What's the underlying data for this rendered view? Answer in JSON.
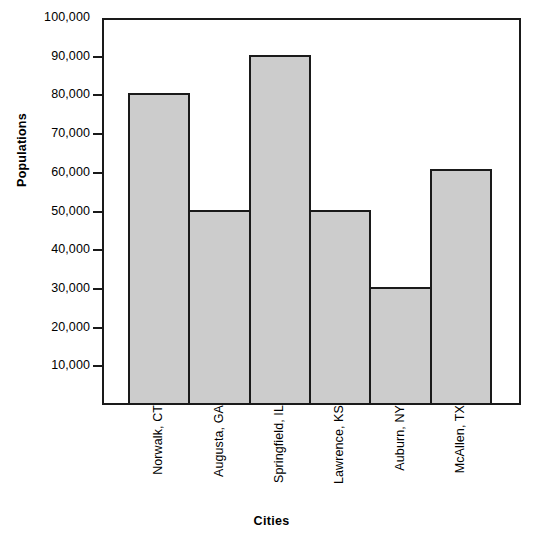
{
  "chart_data": {
    "type": "bar",
    "title": "",
    "xlabel": "Cities",
    "ylabel": "Populations",
    "categories": [
      "Norwalk, CT",
      "Augusta, GA",
      "Springfield, IL",
      "Lawrence, KS",
      "Auburn, NY",
      "McAllen, TX"
    ],
    "values": [
      80000,
      50000,
      90000,
      50000,
      30000,
      60500
    ],
    "ylim": [
      0,
      100000
    ],
    "ytick_values": [
      10000,
      20000,
      30000,
      40000,
      50000,
      60000,
      70000,
      80000,
      90000,
      100000
    ],
    "ytick_labels": [
      "10,000",
      "20,000",
      "30,000",
      "40,000",
      "50,000",
      "60,000",
      "70,000",
      "80,000",
      "90,000",
      "100,000"
    ],
    "grid": false,
    "legend": null,
    "bar_fill_color": "#cccccc",
    "bar_edge_color": "#1a1a1a",
    "axis_color": "#1a1a1a",
    "background_color": "#ffffff"
  }
}
